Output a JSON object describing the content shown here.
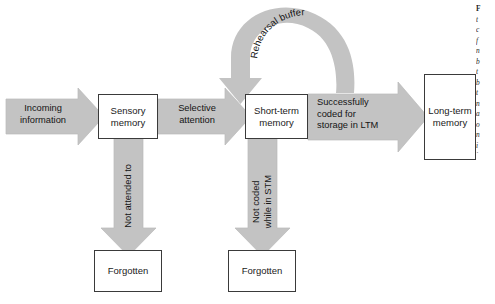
{
  "diagram": {
    "type": "flow-diagram",
    "colors": {
      "arrow_fill": "#c3c3c3",
      "arrow_stroke": "#b4b4b4",
      "box_border": "#3a3a3a",
      "box_fill": "#ffffff",
      "text": "#1a1a1a",
      "background": "#ffffff"
    },
    "boxes": [
      {
        "id": "sensory-memory",
        "lines": [
          "Sensory",
          "memory"
        ],
        "x": 98,
        "y": 94,
        "w": 60,
        "h": 45
      },
      {
        "id": "short-term-memory",
        "lines": [
          "Short-term",
          "memory"
        ],
        "x": 245,
        "y": 94,
        "w": 63,
        "h": 45
      },
      {
        "id": "long-term-memory",
        "lines": [
          "Long-term",
          "memory"
        ],
        "x": 424,
        "y": 74,
        "w": 52,
        "h": 86
      },
      {
        "id": "forgotten-sensory",
        "lines": [
          "Forgotten"
        ],
        "x": 94,
        "y": 250,
        "w": 68,
        "h": 42
      },
      {
        "id": "forgotten-stm",
        "lines": [
          "Forgotten"
        ],
        "x": 228,
        "y": 250,
        "w": 68,
        "h": 42
      }
    ],
    "arrows": [
      {
        "id": "incoming-information",
        "label_lines": [
          "Incoming",
          "information"
        ],
        "direction": "right",
        "label_align": "center",
        "label_x": 12,
        "label_y": 103,
        "label_w": 62
      },
      {
        "id": "selective-attention",
        "label_lines": [
          "Selective",
          "attention"
        ],
        "direction": "right",
        "label_align": "center",
        "label_x": 166,
        "label_y": 103,
        "label_w": 62
      },
      {
        "id": "successfully-coded",
        "label_lines": [
          "Successfully",
          "coded for",
          "storage in LTM"
        ],
        "direction": "right",
        "label_align": "left",
        "label_x": 317,
        "label_y": 97,
        "label_w": 86
      },
      {
        "id": "not-attended-to",
        "label_lines": [
          "Not attended to"
        ],
        "direction": "down",
        "label_align": "center",
        "rotated": true,
        "label_x": 128,
        "label_y": 196
      },
      {
        "id": "not-coded-while-in-stm",
        "label_lines": [
          "Not coded",
          "while in STM"
        ],
        "direction": "down",
        "label_align": "center",
        "rotated": true,
        "label_x": 262,
        "label_y": 196
      },
      {
        "id": "rehearsal-buffer",
        "label_lines": [
          "Rehearsal buffer"
        ],
        "direction": "loop",
        "label_align": "curved",
        "curved_text": "Rehearsal buffer"
      }
    ],
    "caption": {
      "visible_fragment": "cropped italic caption column at right edge",
      "lines": [
        "F",
        "t",
        "c",
        "f",
        "n",
        "b",
        "t",
        "b",
        "t",
        "n",
        "a",
        "o",
        "n",
        "i",
        "i",
        "n",
        "i"
      ]
    }
  }
}
